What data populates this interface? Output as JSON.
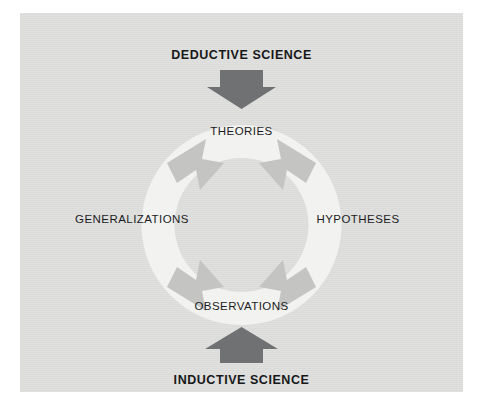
{
  "figure": {
    "background_color": "#ffffff",
    "panel_color": "#dededd",
    "ring_color": "#f1f1ef",
    "ring_arrow_color": "#c3c3c1",
    "block_arrow_color": "#6f7173",
    "text_color": "#17181a"
  },
  "headers": {
    "top": "DEDUCTIVE SCIENCE",
    "bottom": "INDUCTIVE SCIENCE"
  },
  "arrows": {
    "top_entry": "down-arrow",
    "bottom_entry": "up-arrow",
    "cycle_direction": "clockwise"
  },
  "cycle": {
    "stages": [
      {
        "id": "theories",
        "label": "THEORIES",
        "position": "top"
      },
      {
        "id": "hypotheses",
        "label": "HYPOTHESES",
        "position": "right"
      },
      {
        "id": "observations",
        "label": "OBSERVATIONS",
        "position": "bottom"
      },
      {
        "id": "generalizations",
        "label": "GENERALIZATIONS",
        "position": "left"
      }
    ]
  }
}
